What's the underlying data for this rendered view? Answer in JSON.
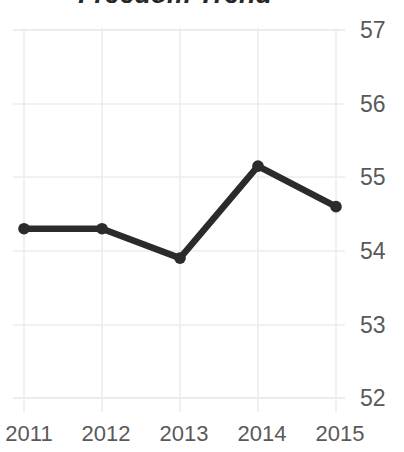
{
  "chart_data": {
    "type": "line",
    "title": "Freedom Trend",
    "xlabel": "",
    "ylabel": "",
    "x": [
      "2011",
      "2012",
      "2013",
      "2014",
      "2015"
    ],
    "categories": [
      "2011",
      "2012",
      "2013",
      "2014",
      "2015"
    ],
    "values": [
      54.3,
      54.3,
      53.9,
      55.15,
      54.6
    ],
    "series": [
      {
        "name": "Freedom Score",
        "values": [
          54.3,
          54.3,
          53.9,
          55.15,
          54.6
        ]
      }
    ],
    "ylim": [
      52,
      57
    ],
    "yticks": [
      52,
      53,
      54,
      55,
      56,
      57
    ],
    "ytick_labels": [
      "52",
      "53",
      "54",
      "55",
      "56",
      "57"
    ],
    "xtick_labels": [
      "2011",
      "2012",
      "2013",
      "2014",
      "2015"
    ],
    "y_axis_position": "right",
    "grid": true,
    "grid_color": "#e8e8e8",
    "legend": false,
    "legend_position": "none",
    "line_color": "#2b2b2b",
    "marker": "circle",
    "marker_color": "#2b2b2b",
    "background_color": "#ffffff",
    "title_color": "#262626",
    "tick_label_color": "#5a5a5a",
    "annotations": []
  },
  "axes": {
    "y_ticks": [
      {
        "label": "57",
        "value": 57
      },
      {
        "label": "56",
        "value": 56
      },
      {
        "label": "55",
        "value": 55
      },
      {
        "label": "54",
        "value": 54
      },
      {
        "label": "53",
        "value": 53
      },
      {
        "label": "52",
        "value": 52
      }
    ],
    "x_ticks": [
      {
        "label": "2011"
      },
      {
        "label": "2012"
      },
      {
        "label": "2013"
      },
      {
        "label": "2014"
      },
      {
        "label": "2015"
      }
    ]
  }
}
